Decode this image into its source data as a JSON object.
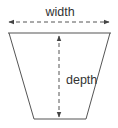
{
  "diagram": {
    "shape": "trapezoid",
    "labels": {
      "width": "width",
      "depth": "depth"
    },
    "colors": {
      "outline": "#555555",
      "dimension_line": "#555555",
      "text": "#333333"
    },
    "icons": {
      "width_arrow": "double-headed-horizontal-dashed-arrow",
      "depth_arrow": "double-headed-vertical-dashed-arrow"
    }
  }
}
